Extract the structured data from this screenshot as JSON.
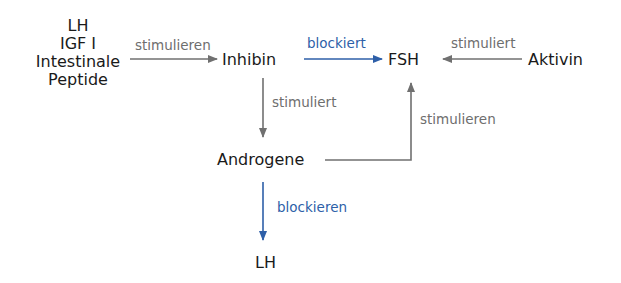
{
  "colors": {
    "stimulate": "#707070",
    "block": "#2e5fa8",
    "node_text": "#1a1a1a"
  },
  "nodes": {
    "source_group": [
      "LH",
      "IGF I",
      "Intestinale",
      "Peptide"
    ],
    "inhibin": "Inhibin",
    "fsh": "FSH",
    "aktivin": "Aktivin",
    "androgene": "Androgene",
    "lh_bottom": "LH"
  },
  "edges": [
    {
      "from": "LH / IGF I / Intestinale Peptide",
      "to": "Inhibin",
      "label": "stimulieren",
      "type": "stimulate"
    },
    {
      "from": "Inhibin",
      "to": "FSH",
      "label": "blockiert",
      "type": "block"
    },
    {
      "from": "Aktivin",
      "to": "FSH",
      "label": "stimuliert",
      "type": "stimulate"
    },
    {
      "from": "Inhibin",
      "to": "Androgene",
      "label": "stimuliert",
      "type": "stimulate"
    },
    {
      "from": "Androgene",
      "to": "FSH",
      "label": "stimulieren",
      "type": "stimulate"
    },
    {
      "from": "Androgene",
      "to": "LH",
      "label": "blockieren",
      "type": "block"
    }
  ]
}
